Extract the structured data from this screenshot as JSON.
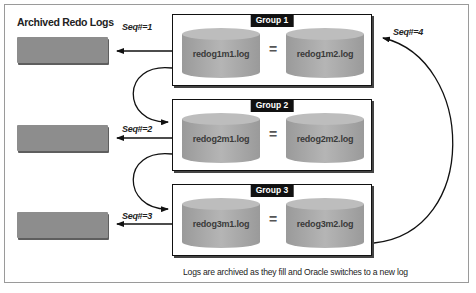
{
  "title": "Archived Redo Logs",
  "caption": "Logs are archived as they fill and Oracle switches to a new log",
  "equals_symbol": "=",
  "groups": [
    {
      "label": "Group 1",
      "member1": "redog1m1.log",
      "member2": "redog1m2.log",
      "seq": "Seq#=1"
    },
    {
      "label": "Group 2",
      "member1": "redog2m1.log",
      "member2": "redog2m2.log",
      "seq": "Seq#=2"
    },
    {
      "label": "Group 3",
      "member1": "redog3m1.log",
      "member2": "redog3m2.log",
      "seq": "Seq#=3"
    }
  ],
  "wraparound_seq": "Seq#=4",
  "colors": {
    "archive_bar": "#8d8d8d",
    "cylinder": "#a8a8a8",
    "group_border": "#111111",
    "label_bg": "#111111",
    "label_text": "#ffffff"
  }
}
